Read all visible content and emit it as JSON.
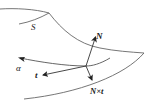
{
  "diagram": {
    "type": "surface-curve-frame",
    "labels": {
      "surface": "S",
      "normal": "N",
      "curve": "α",
      "tangent": "t",
      "cross": "N×t"
    },
    "colors": {
      "stroke": "#555555",
      "arrow": "#222222",
      "text": "#1a1a1a",
      "background": "#ffffff"
    },
    "vectors": [
      {
        "name": "N",
        "from": [
          86,
          66
        ],
        "to": [
          96,
          36
        ]
      },
      {
        "name": "t",
        "from": [
          86,
          66
        ],
        "to": [
          43,
          75
        ]
      },
      {
        "name": "N×t",
        "from": [
          86,
          66
        ],
        "to": [
          92,
          80
        ]
      }
    ]
  }
}
